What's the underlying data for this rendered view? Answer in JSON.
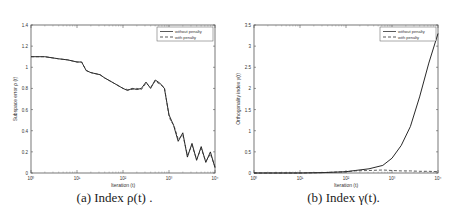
{
  "chart_data": [
    {
      "type": "line",
      "title": "",
      "caption": "(a) Index ρ(t) .",
      "xlabel": "Iteration (t)",
      "ylabel": "Subspace error  ρ (t)",
      "xscale": "log",
      "xlim": [
        1,
        10000
      ],
      "ylim": [
        0,
        1.4
      ],
      "xticks": [
        "10⁰",
        "10¹",
        "10²",
        "10³",
        "10⁴"
      ],
      "yticks": [
        "0",
        "0.2",
        "0.4",
        "0.6",
        "0.8",
        "1",
        "1.2",
        "1.4"
      ],
      "grid": false,
      "legend": {
        "position": "top-right",
        "entries": [
          "without penalty",
          "with penalty"
        ]
      },
      "series": [
        {
          "name": "without penalty",
          "style": "solid",
          "log10_x": [
            0,
            0.3,
            0.6,
            0.8,
            1.0,
            1.1,
            1.2,
            1.3,
            1.5,
            1.6,
            1.8,
            2.0,
            2.1,
            2.2,
            2.3,
            2.4,
            2.5,
            2.6,
            2.7,
            2.8,
            2.9,
            3.0,
            3.05,
            3.1,
            3.2,
            3.3,
            3.4,
            3.5,
            3.6,
            3.7,
            3.8,
            3.9,
            4.0
          ],
          "y": [
            1.1,
            1.1,
            1.08,
            1.07,
            1.05,
            1.05,
            0.97,
            0.95,
            0.93,
            0.9,
            0.85,
            0.8,
            0.78,
            0.8,
            0.79,
            0.8,
            0.86,
            0.8,
            0.88,
            0.85,
            0.8,
            0.55,
            0.5,
            0.45,
            0.3,
            0.38,
            0.15,
            0.28,
            0.12,
            0.25,
            0.1,
            0.2,
            0.05
          ]
        },
        {
          "name": "with penalty",
          "style": "dashed",
          "log10_x": [
            0,
            0.3,
            0.6,
            0.8,
            1.0,
            1.1,
            1.2,
            1.3,
            1.5,
            1.6,
            1.8,
            2.0,
            2.1,
            2.2,
            2.3,
            2.4,
            2.5,
            2.6,
            2.7,
            2.8,
            2.9,
            3.0,
            3.05,
            3.1,
            3.2,
            3.3,
            3.4,
            3.5,
            3.6,
            3.7,
            3.8,
            3.9,
            4.0
          ],
          "y": [
            1.1,
            1.1,
            1.08,
            1.07,
            1.05,
            1.05,
            0.97,
            0.95,
            0.93,
            0.9,
            0.85,
            0.8,
            0.79,
            0.79,
            0.8,
            0.79,
            0.85,
            0.81,
            0.87,
            0.84,
            0.81,
            0.54,
            0.48,
            0.46,
            0.32,
            0.36,
            0.17,
            0.26,
            0.13,
            0.23,
            0.11,
            0.18,
            0.06
          ]
        }
      ]
    },
    {
      "type": "line",
      "title": "",
      "caption": "(b) Index γ(t).",
      "xlabel": "Iteration (t)",
      "ylabel": "Orthogonality index  γ(t)",
      "xscale": "log",
      "xlim": [
        1,
        10000
      ],
      "ylim": [
        0,
        3.5
      ],
      "xticks": [
        "10⁰",
        "10¹",
        "10²",
        "10³",
        "10⁴"
      ],
      "yticks": [
        "0",
        "0.5",
        "1",
        "1.5",
        "2",
        "2.5",
        "3",
        "3.5"
      ],
      "grid": false,
      "legend": {
        "position": "top-right",
        "entries": [
          "without penalty",
          "with penalty"
        ]
      },
      "series": [
        {
          "name": "without penalty",
          "style": "solid",
          "log10_x": [
            0,
            1.0,
            1.5,
            2.0,
            2.2,
            2.5,
            2.8,
            3.0,
            3.2,
            3.4,
            3.6,
            3.8,
            4.0
          ],
          "y": [
            0,
            0,
            0.01,
            0.03,
            0.06,
            0.1,
            0.18,
            0.35,
            0.65,
            1.1,
            1.8,
            2.6,
            3.3
          ]
        },
        {
          "name": "with penalty",
          "style": "dashed",
          "log10_x": [
            0,
            1.0,
            1.5,
            2.0,
            2.2,
            2.5,
            2.8,
            3.0,
            3.2,
            3.4,
            3.6,
            3.8,
            4.0
          ],
          "y": [
            0,
            0,
            0.01,
            0.03,
            0.05,
            0.06,
            0.07,
            0.06,
            0.05,
            0.05,
            0.04,
            0.04,
            0.03
          ]
        }
      ]
    }
  ]
}
